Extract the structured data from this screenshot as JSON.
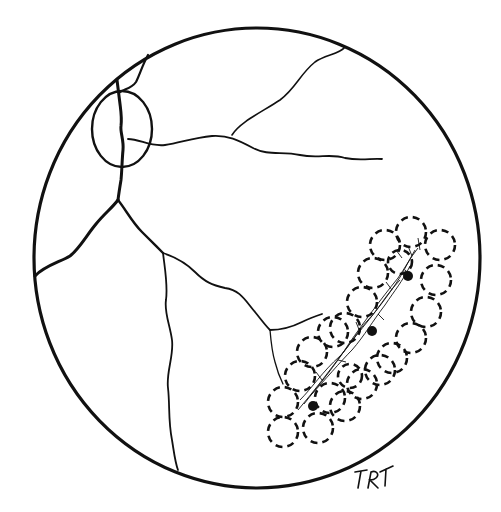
{
  "figure": {
    "type": "fundus-illustration",
    "signature": "TRT",
    "colors": {
      "ink": "#111111",
      "background": "#ffffff"
    },
    "elements": {
      "fundus_boundary": "circle",
      "optic_disc": "ellipse",
      "vessels": [
        "superior-temporal",
        "inferior-temporal-branch",
        "inferior-nasal",
        "inferior-descending"
      ],
      "lesion_markers": {
        "dashed_circles": 22,
        "dot_markers": 3
      }
    }
  }
}
